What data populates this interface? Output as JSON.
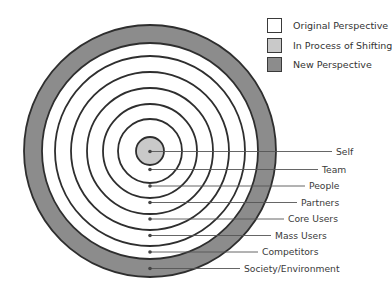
{
  "colors": {
    "original": "#ffffff",
    "shifting": "#c9c9c9",
    "new": "#8c8c8c",
    "stroke": "#2e2e2e",
    "leader": "#555555"
  },
  "legend": [
    {
      "label": "Original Perspective",
      "color": "#ffffff"
    },
    {
      "label": "In Process of Shifting",
      "color": "#c9c9c9"
    },
    {
      "label": "New Perspective",
      "color": "#8c8c8c"
    }
  ],
  "rings": [
    {
      "label": "Self",
      "state": "shifting"
    },
    {
      "label": "Team",
      "state": "original"
    },
    {
      "label": "People",
      "state": "original"
    },
    {
      "label": "Partners",
      "state": "original"
    },
    {
      "label": "Core Users",
      "state": "original"
    },
    {
      "label": "Mass Users",
      "state": "original"
    },
    {
      "label": "Competitors",
      "state": "original"
    },
    {
      "label": "Society/Environment",
      "state": "new"
    }
  ]
}
